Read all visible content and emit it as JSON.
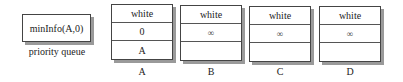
{
  "priority_queue": {
    "entry": "minInfo(A,0)",
    "label": "priority queue"
  },
  "vertices": [
    {
      "name": "A",
      "color": "white",
      "distance": "0",
      "parent": "A"
    },
    {
      "name": "B",
      "color": "white",
      "distance": "∞",
      "parent": ""
    },
    {
      "name": "C",
      "color": "white",
      "distance": "∞",
      "parent": ""
    },
    {
      "name": "D",
      "color": "white",
      "distance": "∞",
      "parent": ""
    }
  ]
}
